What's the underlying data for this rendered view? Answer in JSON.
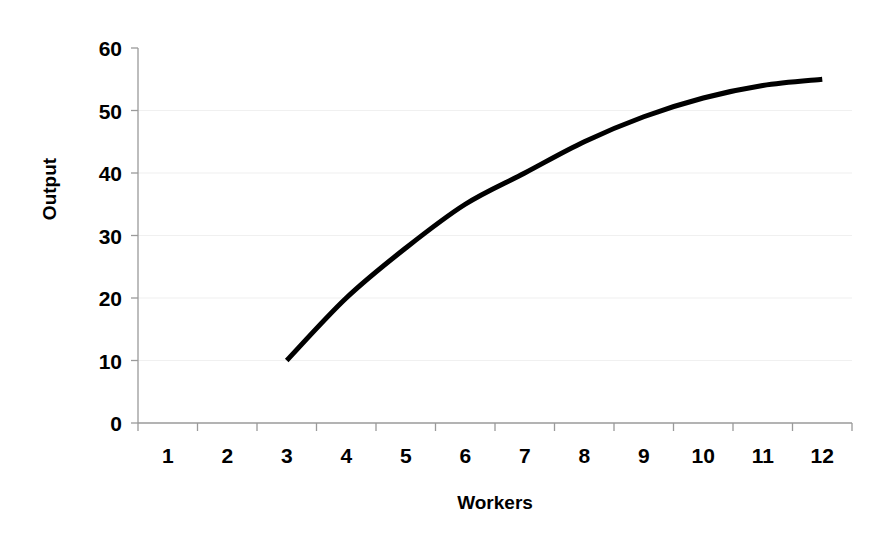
{
  "chart_data": {
    "type": "line",
    "title": "",
    "subtitle": "",
    "xlabel": "Workers",
    "ylabel": "Output",
    "x": [
      3,
      4,
      5,
      6,
      7,
      8,
      9,
      10,
      11,
      12
    ],
    "values": [
      10,
      20,
      28,
      35,
      40,
      45,
      49,
      52,
      54,
      55
    ],
    "series": [
      {
        "name": "Total Product",
        "x": [
          3,
          4,
          5,
          6,
          7,
          8,
          9,
          10,
          11,
          12
        ],
        "values": [
          10,
          20,
          28,
          35,
          40,
          45,
          49,
          52,
          54,
          55
        ],
        "color": "#000000",
        "line_width": 5
      }
    ],
    "x_categories": [
      "1",
      "2",
      "3",
      "4",
      "5",
      "6",
      "7",
      "8",
      "9",
      "10",
      "11",
      "12"
    ],
    "x_tick_labels": [
      "1",
      "2",
      "3",
      "4",
      "5",
      "6",
      "7",
      "8",
      "9",
      "10",
      "11",
      "12"
    ],
    "y_tick_labels": [
      "0",
      "10",
      "20",
      "30",
      "40",
      "50",
      "60"
    ],
    "y_ticks": [
      0,
      10,
      20,
      30,
      40,
      50,
      60
    ],
    "xlim": [
      0.5,
      12.5
    ],
    "ylim": [
      0,
      60
    ],
    "grid": "horizontal",
    "grid_color": "#f0f0f0",
    "axis_color": "#9a9a9a",
    "background": "#ffffff",
    "legend": "none",
    "annotations": []
  },
  "colors": {
    "line": "#000000",
    "text": "#000000",
    "gridline": "#f0f0f0",
    "axis": "#9a9a9a",
    "background": "#ffffff"
  }
}
